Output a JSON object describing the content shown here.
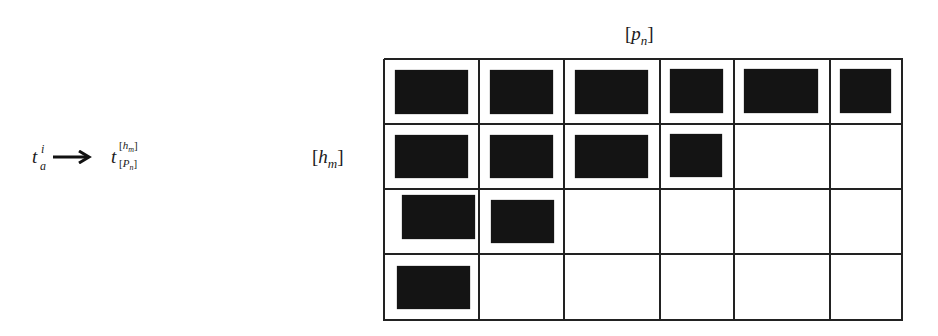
{
  "formula": {
    "source": {
      "base": "t",
      "superscript": "i",
      "subscript": "a"
    },
    "arrow": "→",
    "target": {
      "base": "t",
      "superscript": "[h_m]",
      "subscript": "[P_n]"
    }
  },
  "grid": {
    "row_axis_label": "[h_m]",
    "column_axis_label": "[p_n]",
    "rows": 4,
    "columns": 6,
    "filled_cells_per_row": [
      6,
      4,
      2,
      1
    ],
    "column_lines_x": [
      384,
      479,
      564,
      660,
      734,
      830,
      902
    ],
    "row_lines_y": [
      59,
      124,
      189,
      254,
      320
    ],
    "blocks": [
      {
        "row": 1,
        "col": 1,
        "x": 395,
        "y": 70,
        "w": 73,
        "h": 44
      },
      {
        "row": 1,
        "col": 2,
        "x": 490,
        "y": 70,
        "w": 63,
        "h": 44
      },
      {
        "row": 1,
        "col": 3,
        "x": 575,
        "y": 70,
        "w": 73,
        "h": 44
      },
      {
        "row": 1,
        "col": 4,
        "x": 670,
        "y": 69,
        "w": 53,
        "h": 44
      },
      {
        "row": 1,
        "col": 5,
        "x": 744,
        "y": 69,
        "w": 74,
        "h": 44
      },
      {
        "row": 1,
        "col": 6,
        "x": 840,
        "y": 69,
        "w": 51,
        "h": 44
      },
      {
        "row": 2,
        "col": 1,
        "x": 395,
        "y": 135,
        "w": 73,
        "h": 43
      },
      {
        "row": 2,
        "col": 2,
        "x": 490,
        "y": 135,
        "w": 63,
        "h": 43
      },
      {
        "row": 2,
        "col": 3,
        "x": 575,
        "y": 135,
        "w": 73,
        "h": 43
      },
      {
        "row": 2,
        "col": 4,
        "x": 670,
        "y": 134,
        "w": 52,
        "h": 43
      },
      {
        "row": 3,
        "col": 1,
        "x": 402,
        "y": 195,
        "w": 73,
        "h": 44
      },
      {
        "row": 3,
        "col": 2,
        "x": 491,
        "y": 200,
        "w": 63,
        "h": 43
      },
      {
        "row": 4,
        "col": 1,
        "x": 397,
        "y": 266,
        "w": 73,
        "h": 43
      }
    ]
  }
}
